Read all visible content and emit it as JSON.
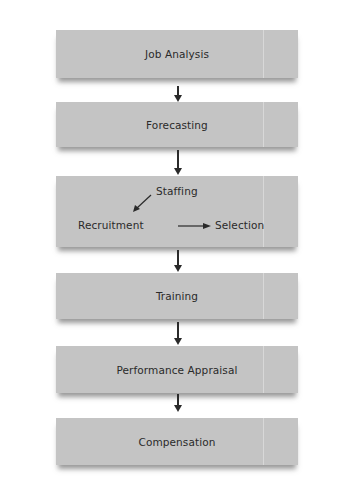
{
  "diagram": {
    "type": "flowchart",
    "direction": "top-to-bottom",
    "steps": [
      {
        "label": "Job Analysis"
      },
      {
        "label": "Forecasting"
      },
      {
        "label": "Staffing",
        "sub": {
          "left": "Recruitment",
          "right": "Selection"
        }
      },
      {
        "label": "Training"
      },
      {
        "label": "Performance Appraisal"
      },
      {
        "label": "Compensation"
      }
    ],
    "colors": {
      "box": "#c4c4c4",
      "text": "#2a2a2a",
      "arrow": "#2a2a2a",
      "background": "#ffffff"
    }
  }
}
